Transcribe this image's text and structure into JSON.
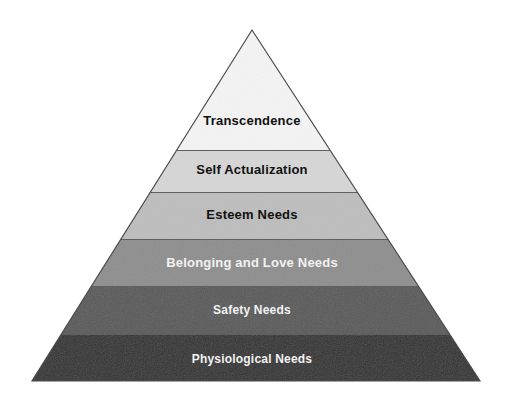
{
  "figure": {
    "background_color": "#ffffff",
    "outline_color": "#4a4a4a",
    "divider_color": "#5f5f5f"
  },
  "chart_data": {
    "type": "pyramid",
    "orientation": "apex-up",
    "level_count": 6,
    "apex": {
      "x": 252,
      "y": 30
    },
    "base_left": {
      "x": 32,
      "y": 381
    },
    "base_right": {
      "x": 480,
      "y": 381
    },
    "levels": [
      {
        "rank": 6,
        "label": "Transcendence",
        "fill": "#f4f4f4",
        "text_color": "#111111",
        "y_top": 30,
        "y_bottom": 150
      },
      {
        "rank": 5,
        "label": "Self Actualization",
        "fill": "#d6d6d6",
        "text_color": "#111111",
        "y_top": 150,
        "y_bottom": 192
      },
      {
        "rank": 4,
        "label": "Esteem Needs",
        "fill": "#bdbdbd",
        "text_color": "#111111",
        "y_top": 192,
        "y_bottom": 239
      },
      {
        "rank": 3,
        "label": "Belonging and Love Needs",
        "fill": "#8e8e8e",
        "text_color": "#f2f2f2",
        "y_top": 239,
        "y_bottom": 286
      },
      {
        "rank": 2,
        "label": "Safety Needs",
        "fill": "#5a5a5a",
        "text_color": "#f2f2f2",
        "y_top": 286,
        "y_bottom": 334
      },
      {
        "rank": 1,
        "label": "Physiological Needs",
        "fill": "#333333",
        "text_color": "#f2f2f2",
        "y_top": 334,
        "y_bottom": 381
      }
    ],
    "label_font_sizes": [
      13,
      13,
      13,
      13,
      12,
      12
    ],
    "legend": null,
    "xlabel": "",
    "ylabel": ""
  }
}
